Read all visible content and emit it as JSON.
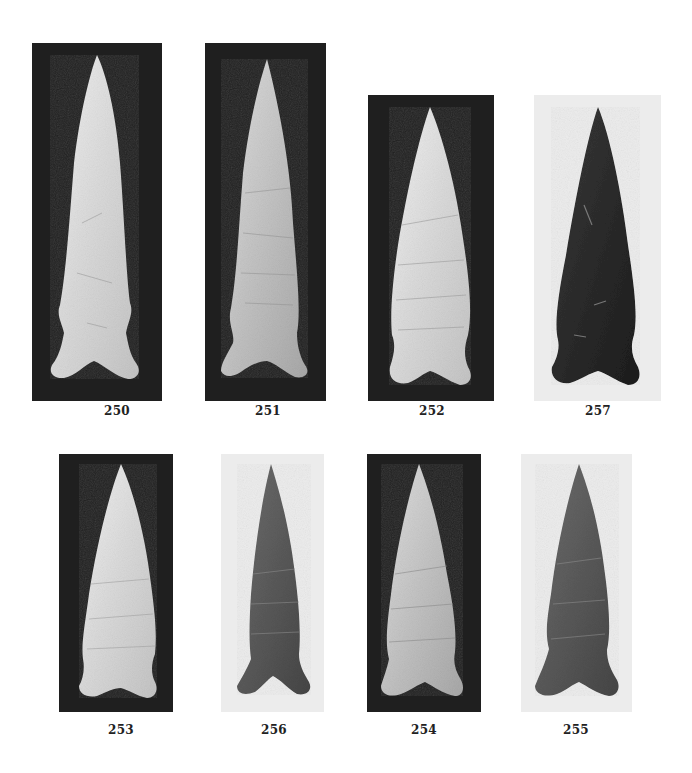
{
  "plate": {
    "description": "Photographic plate of chipped stone projectile points",
    "colors": {
      "page": "#ffffff",
      "dark_bg": "#1e1e1e",
      "light_bg": "#ececec",
      "label": "#222222"
    },
    "items": [
      {
        "number": "250",
        "background": "dark",
        "point_tone": "light"
      },
      {
        "number": "251",
        "background": "dark",
        "point_tone": "light"
      },
      {
        "number": "252",
        "background": "dark",
        "point_tone": "light"
      },
      {
        "number": "257",
        "background": "light",
        "point_tone": "dark"
      },
      {
        "number": "253",
        "background": "dark",
        "point_tone": "light"
      },
      {
        "number": "256",
        "background": "light",
        "point_tone": "dark"
      },
      {
        "number": "254",
        "background": "dark",
        "point_tone": "light"
      },
      {
        "number": "255",
        "background": "light",
        "point_tone": "dark"
      }
    ]
  }
}
